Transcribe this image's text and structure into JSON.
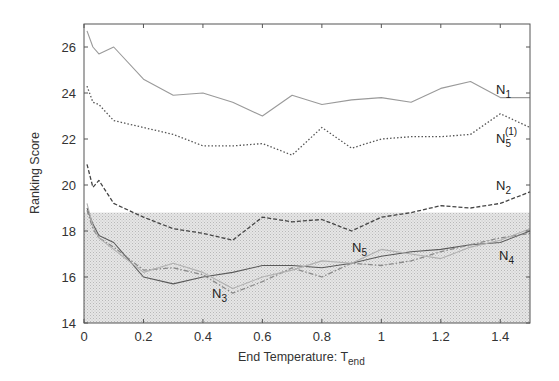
{
  "chart_data": {
    "type": "line",
    "title": "",
    "xlabel": "End Temperature: T",
    "xlabel_subscript": "end",
    "ylabel": "Ranking Score",
    "xlim": [
      0,
      1.5
    ],
    "ylim": [
      14,
      27
    ],
    "xticks": [
      0,
      0.2,
      0.4,
      0.6,
      0.8,
      1,
      1.2,
      1.4
    ],
    "xtick_labels": [
      "0",
      "0.2",
      "0.4",
      "0.6",
      "0.8",
      "1",
      "1.2",
      "1.4"
    ],
    "yticks": [
      14,
      16,
      18,
      20,
      22,
      24,
      26
    ],
    "ytick_labels": [
      "14",
      "16",
      "18",
      "20",
      "22",
      "24",
      "26"
    ],
    "grid": false,
    "shaded_region": {
      "y_from": 14,
      "y_to": 18.8,
      "color": "#d9d9d9"
    },
    "x": [
      0.01,
      0.03,
      0.05,
      0.1,
      0.2,
      0.3,
      0.4,
      0.5,
      0.6,
      0.7,
      0.8,
      0.9,
      1.0,
      1.1,
      1.2,
      1.3,
      1.4,
      1.5
    ],
    "series": [
      {
        "name": "N1",
        "label_main": "N",
        "label_sub": "1",
        "label_sup": "",
        "style": "solid",
        "color": "#9a9a9a",
        "values": [
          26.7,
          26.0,
          25.7,
          26.0,
          24.6,
          23.9,
          24.0,
          23.6,
          23.0,
          23.9,
          23.5,
          23.7,
          23.8,
          23.6,
          24.2,
          24.5,
          23.8,
          23.8
        ]
      },
      {
        "name": "N5(1)",
        "label_main": "N",
        "label_sub": "5",
        "label_sup": "(1)",
        "style": "dotted",
        "color": "#555555",
        "values": [
          24.3,
          23.6,
          23.5,
          22.8,
          22.5,
          22.2,
          21.7,
          21.7,
          21.8,
          21.3,
          22.5,
          21.6,
          22.0,
          22.1,
          22.1,
          22.2,
          23.1,
          22.5
        ]
      },
      {
        "name": "N2",
        "label_main": "N",
        "label_sub": "2",
        "label_sup": "",
        "style": "dashed",
        "color": "#444444",
        "values": [
          20.9,
          19.9,
          20.2,
          19.2,
          18.6,
          18.1,
          17.9,
          17.6,
          18.6,
          18.4,
          18.5,
          18.0,
          18.6,
          18.8,
          19.1,
          19.0,
          19.2,
          19.7
        ]
      },
      {
        "name": "N4",
        "label_main": "N",
        "label_sub": "4",
        "label_sup": "",
        "style": "solid",
        "color": "#5a5a5a",
        "values": [
          19.0,
          18.3,
          17.8,
          17.5,
          16.0,
          15.7,
          16.0,
          16.2,
          16.5,
          16.5,
          16.4,
          16.6,
          16.9,
          17.1,
          17.2,
          17.4,
          17.5,
          18.0
        ]
      },
      {
        "name": "N3",
        "label_main": "N",
        "label_sub": "3",
        "label_sup": "",
        "style": "dashdot",
        "color": "#8a8a8a",
        "values": [
          18.9,
          18.1,
          17.7,
          17.3,
          16.3,
          16.4,
          16.1,
          15.3,
          15.8,
          16.4,
          16.0,
          16.6,
          16.5,
          16.7,
          17.1,
          17.4,
          17.7,
          17.9
        ]
      },
      {
        "name": "N5",
        "label_main": "N",
        "label_sub": "5",
        "label_sup": "",
        "style": "solid",
        "color": "#b0b0b0",
        "values": [
          19.2,
          18.2,
          17.7,
          17.2,
          16.2,
          16.6,
          16.2,
          15.5,
          16.0,
          16.3,
          16.7,
          16.6,
          17.2,
          17.0,
          16.8,
          17.3,
          17.6,
          18.1
        ]
      }
    ],
    "annotations": [
      {
        "series": "N1",
        "x_px": 496,
        "y_px": 94
      },
      {
        "series": "N5(1)",
        "x_px": 496,
        "y_px": 143
      },
      {
        "series": "N2",
        "x_px": 496,
        "y_px": 190
      },
      {
        "series": "N5",
        "x_px": 352,
        "y_px": 252
      },
      {
        "series": "N4",
        "x_px": 499,
        "y_px": 260
      },
      {
        "series": "N3",
        "x_px": 212,
        "y_px": 298
      }
    ],
    "legend": "none (inline labels)"
  }
}
